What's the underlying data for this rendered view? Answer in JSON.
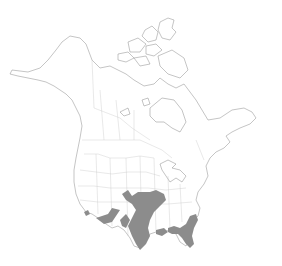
{
  "map": {
    "title": "North America species range map",
    "region": "North America",
    "colors": {
      "background": "#ffffff",
      "land": "#ffffff",
      "coastline": "#7a7a7a",
      "political_border": "#c8c8c8",
      "range_fill": "#8c8c8c"
    },
    "legend": [],
    "range_areas": [
      {
        "name": "Great Plains to Texas",
        "description": "Kansas, Oklahoma, Missouri south through central Texas"
      },
      {
        "name": "Gulf Coast southeast",
        "description": "Louisiana, Mississippi, Alabama, Georgia, Florida, Carolinas coast"
      },
      {
        "name": "Southwest",
        "description": "Southern Arizona, New Mexico, western Texas"
      },
      {
        "name": "California coast",
        "description": "Small area in southern California"
      }
    ]
  }
}
